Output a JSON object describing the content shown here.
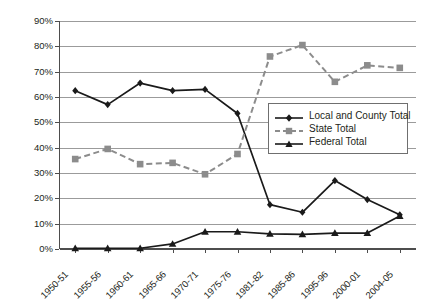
{
  "chart_data": {
    "type": "line",
    "title": "",
    "xlabel": "",
    "ylabel": "",
    "ylim": [
      0,
      90
    ],
    "ytick_step": 10,
    "grid": true,
    "legend_position": "inside-right",
    "categories": [
      "1950-51",
      "1955-56",
      "1960-61",
      "1965-66",
      "1970-71",
      "1975-76",
      "1981-82",
      "1985-86",
      "1995-96",
      "2000-01",
      "2004-05"
    ],
    "ytick_labels": [
      "0%",
      "10%",
      "20%",
      "30%",
      "40%",
      "50%",
      "60%",
      "70%",
      "80%",
      "90%"
    ],
    "ytick_values": [
      0,
      10,
      20,
      30,
      40,
      50,
      60,
      70,
      80,
      90
    ],
    "series": [
      {
        "name": "Local and County Total",
        "color": "#1a1a1a",
        "marker": "diamond",
        "dash": "solid",
        "values": [
          62.5,
          57.0,
          65.5,
          62.5,
          63.0,
          53.5,
          17.5,
          14.5,
          27.0,
          19.5,
          13.5
        ]
      },
      {
        "name": "State Total",
        "color": "#8c8c8c",
        "marker": "square",
        "dash": "dashed",
        "values": [
          35.5,
          39.5,
          33.5,
          34.0,
          29.5,
          37.5,
          76.0,
          80.5,
          66.0,
          72.5,
          71.5
        ]
      },
      {
        "name": "Federal Total",
        "color": "#1a1a1a",
        "marker": "triangle",
        "dash": "solid",
        "values": [
          0.3,
          0.3,
          0.3,
          2.0,
          6.8,
          6.8,
          6.0,
          5.8,
          6.3,
          6.3,
          13.0
        ]
      }
    ]
  },
  "legend": {
    "items": [
      {
        "label": "Local and County Total"
      },
      {
        "label": "State Total"
      },
      {
        "label": "Federal Total"
      }
    ]
  }
}
